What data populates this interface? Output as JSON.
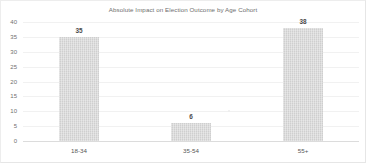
{
  "chart_data": {
    "type": "bar",
    "title": "Absolute Impact on Election Outcome by Age Cohort",
    "xlabel": "",
    "ylabel": "",
    "categories": [
      "18-34",
      "35-54",
      "55+"
    ],
    "values": [
      35,
      6,
      38
    ],
    "data_labels": [
      "35",
      "6",
      "38"
    ],
    "ylim": [
      0,
      40
    ],
    "ytick_labels": [
      "40",
      "35",
      "30",
      "25",
      "20",
      "15",
      "10",
      "5",
      "0"
    ],
    "ytick_values": [
      40,
      35,
      30,
      25,
      20,
      15,
      10,
      5,
      0
    ],
    "grid": true,
    "legend": false,
    "legend_position": "none",
    "bar_color": "#d4d4d4",
    "gridline_color": "#f1f1f1",
    "axis_color": "#dcdcdc",
    "title_color": "#6e6e6e",
    "label_color": "#555555"
  }
}
